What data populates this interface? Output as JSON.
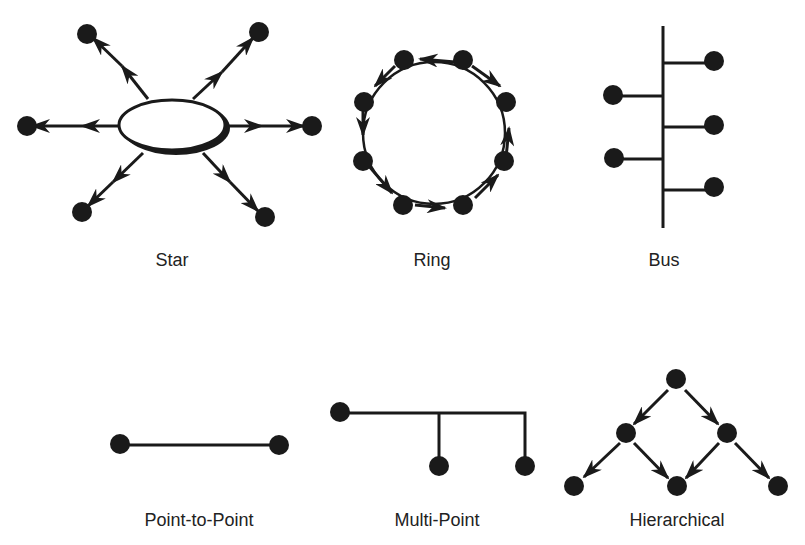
{
  "colors": {
    "ink": "#1a1a1a",
    "background": "#ffffff",
    "text": "#222222"
  },
  "topologies": [
    {
      "id": "star",
      "label": "Star",
      "label_pos": [
        172,
        262
      ]
    },
    {
      "id": "ring",
      "label": "Ring",
      "label_pos": [
        432,
        262
      ]
    },
    {
      "id": "bus",
      "label": "Bus",
      "label_pos": [
        664,
        262
      ]
    },
    {
      "id": "point-to-point",
      "label": "Point-to-Point",
      "label_pos": [
        199,
        521
      ]
    },
    {
      "id": "multi-point",
      "label": "Multi-Point",
      "label_pos": [
        437,
        521
      ]
    },
    {
      "id": "hierarchical",
      "label": "Hierarchical",
      "label_pos": [
        677,
        521
      ]
    }
  ]
}
